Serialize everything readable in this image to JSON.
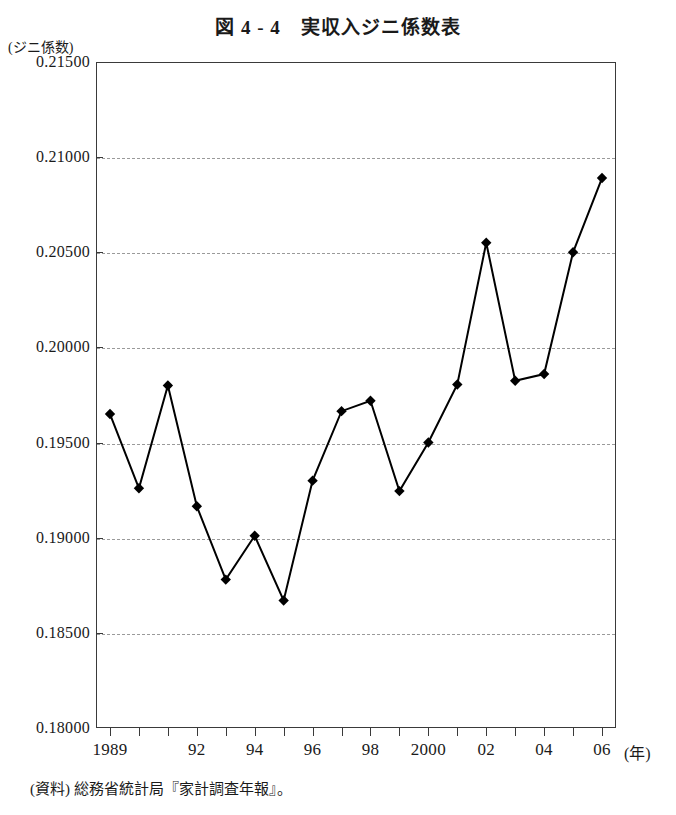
{
  "figure": {
    "title": "図 4 - 4　実収入ジニ係数表",
    "y_axis_unit": "(ジニ係数)",
    "x_axis_unit": "(年)",
    "source_note": "(資料) 総務省統計局『家計調査年報』。"
  },
  "chart_data": {
    "type": "line",
    "title": "図 4 - 4　実収入ジニ係数表",
    "xlabel": "(年)",
    "ylabel": "(ジニ係数)",
    "ylim": [
      0.18,
      0.215
    ],
    "ytick_step": 0.005,
    "ytick_labels": [
      "0.21500",
      "0.21000",
      "0.20500",
      "0.20000",
      "0.19500",
      "0.19000",
      "0.18500",
      "0.18000"
    ],
    "ytick_values": [
      0.215,
      0.21,
      0.205,
      0.2,
      0.195,
      0.19,
      0.185,
      0.18
    ],
    "grid": true,
    "grid_axis": "y",
    "legend": "none",
    "xlim": [
      1989,
      2006
    ],
    "x": [
      1989,
      1990,
      1991,
      1992,
      1993,
      1994,
      1995,
      1996,
      1997,
      1998,
      1999,
      2000,
      2001,
      2002,
      2003,
      2004,
      2005,
      2006
    ],
    "xtick_labels": [
      "1989",
      "",
      "",
      "92",
      "",
      "94",
      "",
      "96",
      "",
      "98",
      "",
      "2000",
      "",
      "02",
      "",
      "04",
      "",
      "06"
    ],
    "marker": "diamond",
    "line_color": "#000000",
    "series": [
      {
        "name": "実収入ジニ係数",
        "values": [
          0.1965,
          0.1926,
          0.198,
          0.19165,
          0.1878,
          0.1901,
          0.1867,
          0.193,
          0.19665,
          0.1972,
          0.19245,
          0.195,
          0.19805,
          0.2055,
          0.19825,
          0.1986,
          0.205,
          0.2089
        ]
      }
    ]
  }
}
